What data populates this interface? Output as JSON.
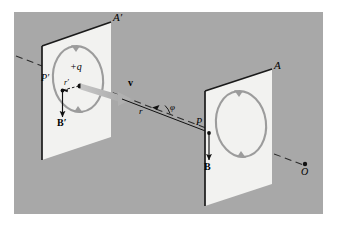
{
  "figure": {
    "kind": "physics-diagram",
    "background_color": "#ffffff",
    "scene_color": "#a8a8a8",
    "frame": {
      "x": 14,
      "y": 12,
      "width": 309,
      "height": 202
    }
  },
  "palette": {
    "scene_gray": "#a8a8a8",
    "plane_fill": "#f2f2f0",
    "plane_edge_dark": "#1a1a1a",
    "field_loop_gray": "#9c9c9c",
    "velocity_arrow_gray": "#b5b5b5",
    "ink_black": "#111111",
    "dash_line": "#2b2b2b"
  },
  "labels": {
    "plane_far_label": "A′",
    "plane_near_label": "A",
    "point_far_label": "P′",
    "point_near_label": "P",
    "charge_label": "+q",
    "velocity_label": "v",
    "field_far_label": "B′",
    "field_near_label": "B",
    "radius_far_label": "r′",
    "radius_near_label": "r",
    "angle_label": "φ",
    "origin_label": "O"
  },
  "elements": {
    "planes": [
      {
        "name": "plane-a-prime",
        "label": "A′",
        "position": "left",
        "orientation": "parallelogram-perspective"
      },
      {
        "name": "plane-a",
        "label": "A",
        "position": "right",
        "orientation": "parallelogram-perspective"
      }
    ],
    "field_loops": [
      {
        "name": "field-loop-far",
        "plane": "A′",
        "direction": "counterclockwise"
      },
      {
        "name": "field-loop-near",
        "plane": "A",
        "direction": "counterclockwise"
      }
    ],
    "vectors": [
      {
        "name": "velocity-vector",
        "label": "v",
        "style": "thick-tapered-gray"
      },
      {
        "name": "magnetic-field-far",
        "label": "B′",
        "style": "thin-black-down"
      },
      {
        "name": "magnetic-field-near",
        "label": "B",
        "style": "thin-black-down"
      },
      {
        "name": "radius-far",
        "label": "r′",
        "style": "thin-dashed-black"
      },
      {
        "name": "radius-near",
        "label": "r",
        "style": "solid-black"
      }
    ],
    "points": [
      {
        "name": "charge-point",
        "label": "+q"
      },
      {
        "name": "field-point-far",
        "label": "P′"
      },
      {
        "name": "field-point-near",
        "label": "P"
      },
      {
        "name": "origin-point",
        "label": "O"
      }
    ],
    "angle_arc": {
      "name": "angle-phi",
      "label": "φ",
      "between": [
        "velocity-axis",
        "radius-r"
      ]
    },
    "axis_line": {
      "name": "motion-axis",
      "style": "dashed",
      "spans": "upper-left to lower-right through O"
    }
  }
}
